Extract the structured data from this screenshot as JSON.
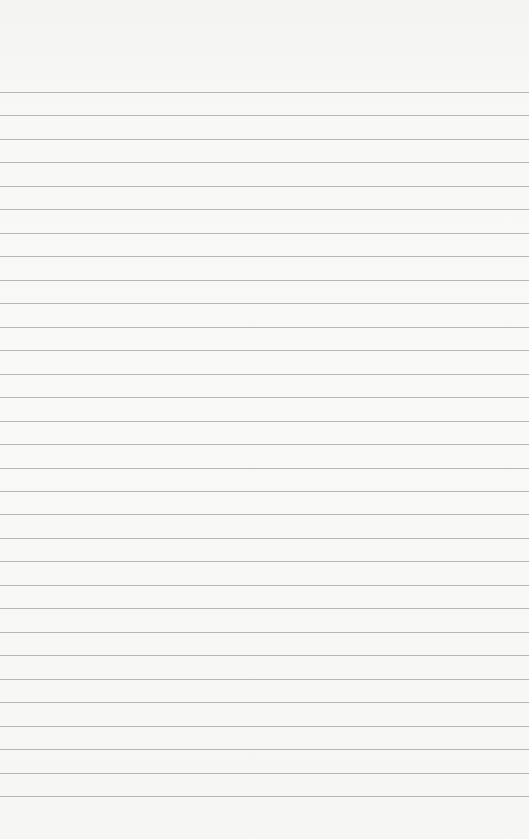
{
  "paper": {
    "type": "lined-paper",
    "background_color": "#f8f8f7",
    "line_color": "#acacac",
    "first_line_y": 92,
    "line_spacing": 23.47,
    "line_count": 31
  }
}
